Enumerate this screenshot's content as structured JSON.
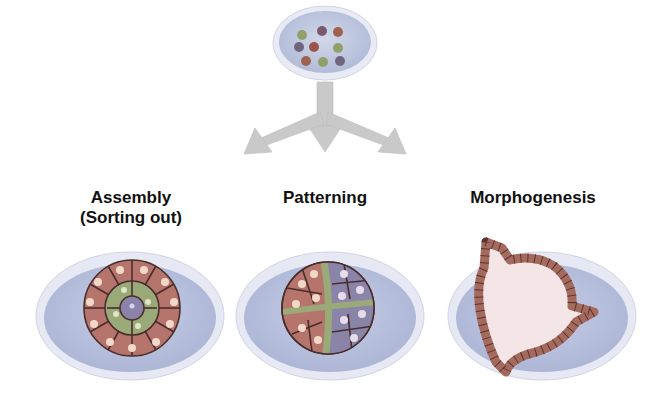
{
  "diagram": {
    "source_dish": {
      "description": "dish with dissociated mixed cells",
      "cell_colors": [
        "#8fa06a",
        "#7a5a70",
        "#a0624f",
        "#6f6580",
        "#9a5548",
        "#8fa06a",
        "#a0624f",
        "#8fa06a",
        "#6f6580"
      ]
    },
    "arrows": {
      "count": 3,
      "directions": [
        "left",
        "down",
        "right"
      ],
      "color": "#c8c8c8"
    },
    "stages": [
      {
        "label_line1": "Assembly",
        "label_line2": "(Sorting out)"
      },
      {
        "label_line1": "Patterning",
        "label_line2": ""
      },
      {
        "label_line1": "Morphogenesis",
        "label_line2": ""
      }
    ],
    "colors": {
      "dish_outer": "#e4e8f3",
      "dish_inner": "#b9c2de",
      "cell_pink": "#b5756c",
      "cell_green": "#9aa978",
      "cell_purple": "#8a84a8",
      "nucleus": "#f2d8c8",
      "lumen": "#f4e6e6"
    }
  }
}
